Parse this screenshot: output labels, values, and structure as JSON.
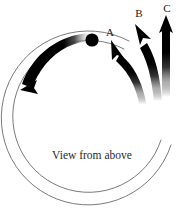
{
  "figure": {
    "caption": "View from above",
    "background_color": "#ffffff",
    "ink_color": "#000000",
    "track_stroke_color": "#6b6b6b"
  },
  "labels": {
    "a": "A",
    "b": "B",
    "c": "C"
  },
  "diagram_data": {
    "type": "diagram",
    "description": "Circular track viewed from above with a ball moving counterclockwise and three candidate exit paths labeled A, B and C",
    "viewbox": [
      0,
      0,
      189,
      224
    ],
    "track": {
      "center": [
        88,
        118
      ],
      "outer_radius": 87,
      "inner_radius": 76,
      "gap_start_deg": -18,
      "gap_end_deg": 62,
      "stroke_width": 0.9
    },
    "ball": {
      "center": [
        92,
        40
      ],
      "radius": 6.5,
      "fill": "#000000"
    },
    "motion_arrow": {
      "direction": "counterclockwise",
      "tail_at_ball": true,
      "head_point": [
        28,
        84
      ],
      "tapered": true,
      "max_width": 9,
      "min_width": 1
    },
    "exit_arrows": [
      {
        "label": "A",
        "tip": [
          113,
          42
        ],
        "angle_deg": 215,
        "label_pos": [
          110,
          32
        ]
      },
      {
        "label": "B",
        "tip": [
          137,
          26
        ],
        "angle_deg": 240,
        "label_pos": [
          139,
          13
        ]
      },
      {
        "label": "C",
        "tip": [
          166,
          17
        ],
        "angle_deg": 270,
        "label_pos": [
          167,
          9
        ]
      }
    ],
    "caption_pos": [
      92,
      156
    ]
  }
}
